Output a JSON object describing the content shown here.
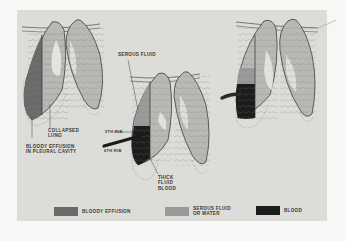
{
  "colors": {
    "background": "#f7f7f5",
    "panel": "#dcdcd8",
    "bloody_effusion": "#6a6a6a",
    "serous_fluid": "#9a9a9a",
    "blood": "#1c1c1c",
    "lung_tissue": "#b8b8b4",
    "outline": "#3c3c3c"
  },
  "labels": {
    "serous_fluid": "SEROUS FLUID",
    "collapsed_lung": "COLLAPSED\nLUNG",
    "bloody_effusion_pleural": "BLOODY EFFUSION\nIN PLEURAL CAVITY",
    "rib_5": "5th RIB",
    "rib_6": "6th RIB",
    "thick_fluid_blood": "THICK\nFLUID\nBLOOD"
  },
  "legend": [
    {
      "label": "BLOODY EFFUSION",
      "color": "#6a6a6a"
    },
    {
      "label": "SEROUS FLUID\nOR WATER",
      "color": "#9a9a9a"
    },
    {
      "label": "BLOOD",
      "color": "#1c1c1c"
    }
  ],
  "figures": [
    {
      "name": "bloody-effusion-collapsed-lung",
      "fill": "bloody_effusion"
    },
    {
      "name": "serous-fluid-over-thick-blood",
      "fill": "serous_and_blood"
    },
    {
      "name": "tube-drain-blood-and-serous",
      "fill": "serous_and_blood"
    }
  ]
}
